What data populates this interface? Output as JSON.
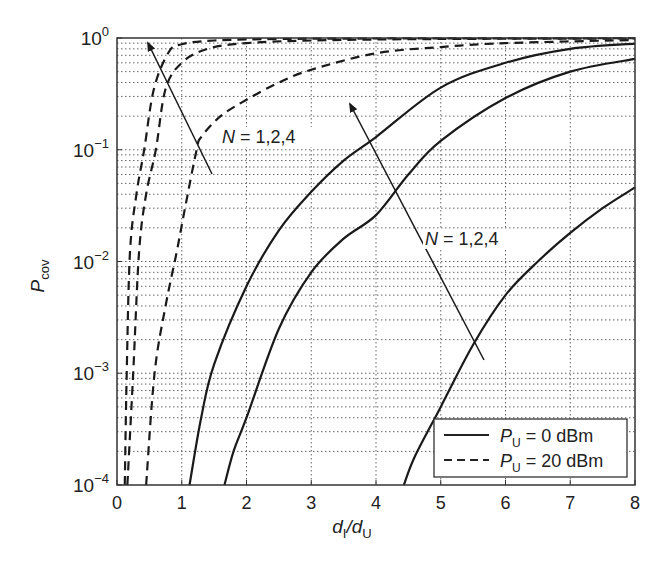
{
  "chart_data": {
    "type": "line",
    "title": "",
    "xlabel": "d_I/d_U",
    "xlabel_parts": {
      "main1": "d",
      "sub1": "I",
      "slash": "/",
      "main2": "d",
      "sub2": "U"
    },
    "ylabel": "P_cov",
    "ylabel_parts": {
      "main": "P",
      "sub": "cov"
    },
    "xscale": "linear",
    "yscale": "log",
    "xlim": [
      0,
      8
    ],
    "ylim": [
      0.0001,
      1
    ],
    "xticks": [
      0,
      1,
      2,
      3,
      4,
      5,
      6,
      7,
      8
    ],
    "xtick_labels": [
      "0",
      "1",
      "2",
      "3",
      "4",
      "5",
      "6",
      "7",
      "8"
    ],
    "yticks": [
      0.0001,
      0.001,
      0.01,
      0.1,
      1
    ],
    "ytick_labels": [
      {
        "base": "10",
        "exp": "−4"
      },
      {
        "base": "10",
        "exp": "−3"
      },
      {
        "base": "10",
        "exp": "−2"
      },
      {
        "base": "10",
        "exp": "−1"
      },
      {
        "base": "10",
        "exp": "0"
      }
    ],
    "grid": true,
    "legend_position": "lower right",
    "legend": [
      {
        "label_main": "P",
        "label_sub": "U",
        "label_rest": " = 0 dBm",
        "style": "solid"
      },
      {
        "label_main": "P",
        "label_sub": "U",
        "label_rest": " = 20 dBm",
        "style": "dashed"
      }
    ],
    "annotations": [
      {
        "text_main": "N",
        "text_rest": " = 1,2,4",
        "x_px": 222,
        "y_px": 143,
        "arrow_from": [
          212,
          174
        ],
        "arrow_to": [
          148,
          43
        ]
      },
      {
        "text_main": "N",
        "text_rest": " = 1,2,4",
        "x_px": 425,
        "y_px": 245,
        "arrow_from": [
          484,
          360
        ],
        "arrow_to": [
          350,
          104
        ]
      }
    ],
    "series": [
      {
        "name": "P_U = 0 dBm, N = 1",
        "style": "solid",
        "x": [
          1.12,
          1.3,
          1.5,
          2.0,
          2.5,
          3.0,
          3.5,
          4.0,
          5.0,
          6.0,
          7.0,
          8.0
        ],
        "y": [
          0.0001,
          0.0004,
          0.0012,
          0.006,
          0.019,
          0.042,
          0.08,
          0.13,
          0.36,
          0.6,
          0.8,
          0.89
        ]
      },
      {
        "name": "P_U = 0 dBm, N = 2",
        "style": "solid",
        "x": [
          1.66,
          1.8,
          2.0,
          2.5,
          3.0,
          3.5,
          4.0,
          4.5,
          5.0,
          6.0,
          7.0,
          8.0
        ],
        "y": [
          0.0001,
          0.0002,
          0.0004,
          0.0025,
          0.008,
          0.016,
          0.026,
          0.06,
          0.12,
          0.29,
          0.5,
          0.65
        ]
      },
      {
        "name": "P_U = 0 dBm, N = 4",
        "style": "solid",
        "x": [
          4.43,
          4.6,
          5.0,
          5.5,
          6.0,
          6.5,
          7.0,
          7.5,
          8.0
        ],
        "y": [
          0.0001,
          0.00018,
          0.0005,
          0.0018,
          0.005,
          0.01,
          0.018,
          0.03,
          0.046
        ]
      },
      {
        "name": "P_U = 20 dBm, N = 1",
        "style": "dashed",
        "x": [
          0.12,
          0.15,
          0.2,
          0.3,
          0.42,
          0.57,
          0.8,
          1.0,
          1.5,
          2.5,
          4.0,
          8.0
        ],
        "y": [
          0.0001,
          0.001,
          0.012,
          0.04,
          0.1,
          0.35,
          0.75,
          0.88,
          0.95,
          0.98,
          0.99,
          0.995
        ]
      },
      {
        "name": "P_U = 20 dBm, N = 2",
        "style": "dashed",
        "x": [
          0.16,
          0.25,
          0.34,
          0.45,
          0.6,
          0.75,
          1.0,
          1.4,
          2.0,
          3.0,
          5.0,
          8.0
        ],
        "y": [
          0.0001,
          0.001,
          0.012,
          0.04,
          0.1,
          0.35,
          0.6,
          0.8,
          0.9,
          0.95,
          0.98,
          0.99
        ]
      },
      {
        "name": "P_U = 20 dBm, N = 4",
        "style": "dashed",
        "x": [
          0.45,
          0.58,
          0.75,
          0.92,
          1.05,
          1.23,
          1.3,
          1.6,
          2.0,
          2.5,
          3.0,
          4.0,
          5.0,
          6.0,
          8.0
        ],
        "y": [
          0.0001,
          0.001,
          0.004,
          0.012,
          0.03,
          0.1,
          0.13,
          0.2,
          0.28,
          0.4,
          0.52,
          0.73,
          0.83,
          0.9,
          0.96
        ]
      }
    ]
  }
}
